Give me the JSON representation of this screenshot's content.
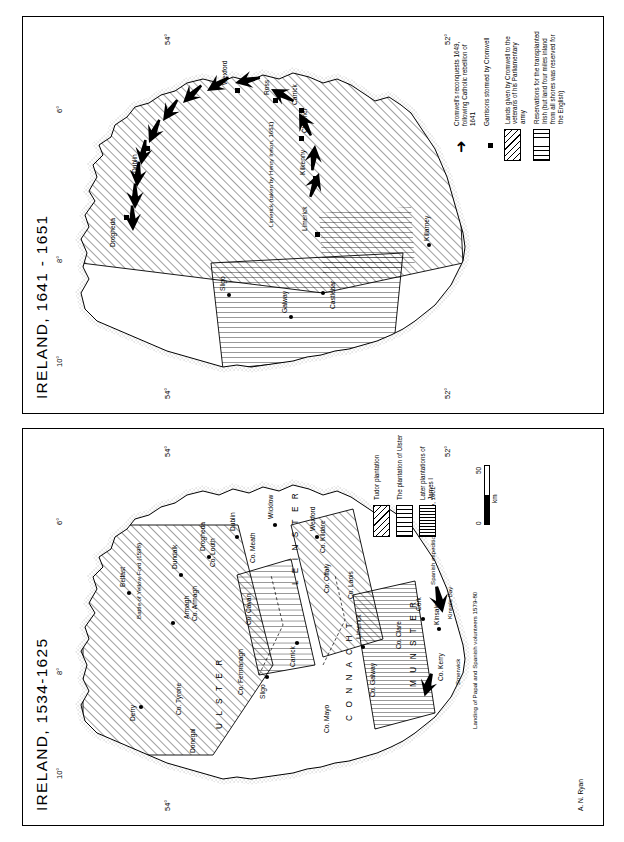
{
  "figure": {
    "credit": "A. N. Ryan",
    "rotation_note": "page content rotated 90 degrees"
  },
  "panels": [
    {
      "id": "left",
      "title": "IRELAND, 1534-1625",
      "graticule": {
        "longitude": [
          "6°",
          "8°",
          "10°"
        ],
        "latitude": [
          "54°",
          "54°",
          "52°"
        ]
      },
      "provinces": [
        "U  L  S  T  E  R",
        "C  O  N  N  A  C  H  T",
        "L E I N S T E R",
        "M  U  N  S  T  E  R"
      ],
      "counties": [
        "Co. Tyrone",
        "Donegal",
        "Co. Fermanagh",
        "Co. Armagh",
        "Co. Cavan",
        "Co. Louth",
        "Co. Meath",
        "Co. Mayo",
        "Co. Galway",
        "Co. Clare",
        "Co. Kerry",
        "Co. Offaly",
        "Co. Laois",
        "Co. Kildare"
      ],
      "places": [
        "Derry",
        "Belfast",
        "Armagh",
        "Dundalk",
        "Drogheda",
        "Dublin",
        "Wicklow",
        "Wexford",
        "Sligo",
        "Carrick",
        "Limerick",
        "Cork",
        "Kinsale"
      ],
      "annotations": [
        "Battle of Yellow Ford (1598)",
        "Landing of Papal and Spanish volunteers 1579-80",
        "Smerwick",
        "Kinsale Bay",
        "Spanish expedition to Kinsale, 1601"
      ],
      "legend": {
        "items": [
          {
            "key": "diagonal-hatch",
            "label": "Tudor plantation"
          },
          {
            "key": "vertical-hatch",
            "label": "The plantation of Ulster"
          },
          {
            "key": "dense-vertical-hatch",
            "label": "Later plantations of James I"
          }
        ]
      },
      "scale": {
        "min": "0",
        "max": "50",
        "unit": "km"
      }
    },
    {
      "id": "right",
      "title": "IRELAND, 1641 - 1651",
      "graticule": {
        "longitude": [
          "6°",
          "8°",
          "10°"
        ],
        "latitude": [
          "54°",
          "54°",
          "52°",
          "52°"
        ]
      },
      "places": [
        "Drogheda",
        "Dublin",
        "Wexford",
        "Ross",
        "Carrick",
        "Clonmel",
        "Kilkenny",
        "Limerick",
        "Sligo",
        "Galway",
        "Castlebar",
        "Killarney"
      ],
      "annotations": [
        "Limerick (taken by Henry Ireton, 1651)"
      ],
      "legend": {
        "items": [
          {
            "key": "arrow",
            "label": "Cromwell's reconquests 1649, following Catholic rebellion of 1641"
          },
          {
            "key": "square",
            "label": "Garrisons stormed by Cromwell"
          },
          {
            "key": "diagonal-hatch",
            "label": "Lands given by Cromwell to the veterans of his Parliamentary army"
          },
          {
            "key": "vertical-hatch",
            "label": "Reservations for the transplanted Irish (but land four miles inland from all shores was reserved for the English)"
          }
        ]
      }
    }
  ]
}
